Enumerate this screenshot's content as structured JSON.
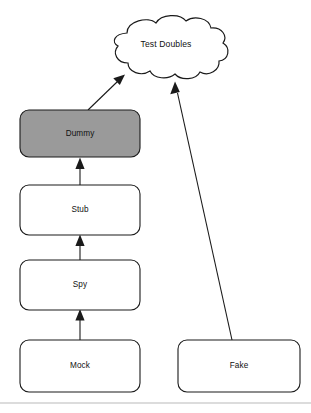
{
  "diagram": {
    "colors": {
      "dummy_fill": "#9a9a9a",
      "box_fill": "#ffffff",
      "stroke": "#1a1a1a",
      "footer_rule": "#b9b9b9",
      "text": "#111111"
    },
    "cloud": {
      "label": "Test Doubles",
      "x": 165,
      "y": 45
    },
    "nodes": [
      {
        "id": "dummy",
        "label": "Dummy",
        "x": 20,
        "y": 110,
        "width": 120,
        "height": 47,
        "fill": "#9a9a9a",
        "highlighted": "true"
      },
      {
        "id": "stub",
        "label": "Stub",
        "x": 20,
        "y": 185,
        "width": 120,
        "height": 50,
        "fill": "#ffffff",
        "highlighted": "false"
      },
      {
        "id": "spy",
        "label": "Spy",
        "x": 20,
        "y": 260,
        "width": 120,
        "height": 50,
        "fill": "#ffffff",
        "highlighted": "false"
      },
      {
        "id": "mock",
        "label": "Mock",
        "x": 20,
        "y": 340,
        "width": 120,
        "height": 52,
        "fill": "#ffffff",
        "highlighted": "false"
      },
      {
        "id": "fake",
        "label": "Fake",
        "x": 178,
        "y": 340,
        "width": 122,
        "height": 52,
        "fill": "#ffffff",
        "highlighted": "false"
      }
    ],
    "edges": [
      {
        "id": "mock-to-spy",
        "from": "mock",
        "to": "spy"
      },
      {
        "id": "spy-to-stub",
        "from": "spy",
        "to": "stub"
      },
      {
        "id": "stub-to-dummy",
        "from": "stub",
        "to": "dummy"
      },
      {
        "id": "dummy-to-cloud",
        "from": "dummy",
        "to": "cloud"
      },
      {
        "id": "fake-to-cloud",
        "from": "fake",
        "to": "cloud"
      }
    ]
  }
}
